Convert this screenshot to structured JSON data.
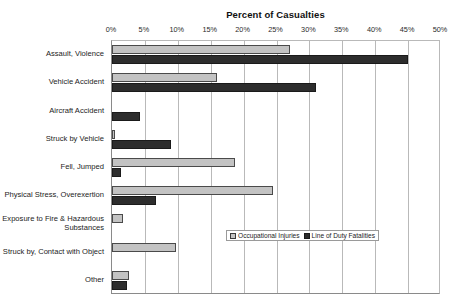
{
  "chart_data": {
    "type": "bar",
    "orientation": "horizontal",
    "title": "Percent of Casualties",
    "xlabel": "",
    "ylabel": "",
    "xlim": [
      0,
      50
    ],
    "xticks": [
      "0%",
      "5%",
      "10%",
      "15%",
      "20%",
      "25%",
      "30%",
      "35%",
      "40%",
      "45%",
      "50%"
    ],
    "xtick_values": [
      0,
      5,
      10,
      15,
      20,
      25,
      30,
      35,
      40,
      45,
      50
    ],
    "grid": true,
    "legend_position": "center-right-inside",
    "categories": [
      "Assault, Violence",
      "Vehicle Accident",
      "Aircraft Accident",
      "Struck by Vehicle",
      "Fell, Jumped",
      "Physical Stress, Overexertion",
      "Exposure to Fire & Hazardous Substances",
      "Struck by, Contact with Object",
      "Other"
    ],
    "series": [
      {
        "name": "Occupational Injuries",
        "color": "#c3c3c3",
        "values": [
          27.0,
          16.0,
          0.0,
          0.5,
          18.7,
          24.5,
          1.6,
          9.7,
          2.6
        ]
      },
      {
        "name": "Line of Duty Fatalities",
        "color": "#2d2d2d",
        "values": [
          45.0,
          31.0,
          4.3,
          9.0,
          1.4,
          6.7,
          0.0,
          0.0,
          2.3
        ]
      }
    ]
  },
  "axis": {
    "title": "Percent of Casualties"
  },
  "legend": {
    "items": [
      {
        "label": "Occupational Injuries"
      },
      {
        "label": "Line of Duty Fatalities"
      }
    ]
  }
}
